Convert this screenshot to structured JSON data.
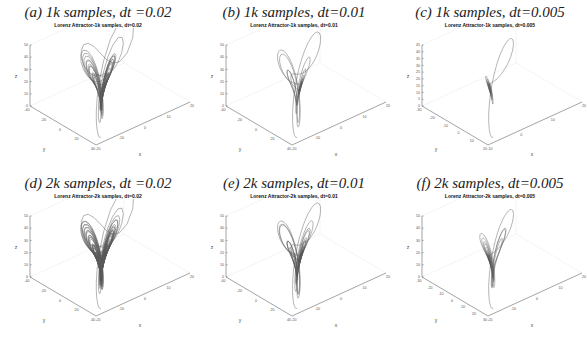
{
  "figure": {
    "panels": [
      {
        "id": "a",
        "caption": "(a) 1k samples, dt =0.02",
        "subtitle": "Lorenz Attractor-1k samples, dt=0.02"
      },
      {
        "id": "b",
        "caption": "(b) 1k samples, dt=0.01",
        "subtitle": "Lorenz Attractor-1k samples, dt=0.01"
      },
      {
        "id": "c",
        "caption": "(c) 1k samples, dt=0.005",
        "subtitle": "Lorenz Attractor-1k samples, dt=0.005"
      },
      {
        "id": "d",
        "caption": "(d) 2k samples, dt =0.02",
        "subtitle": "Lorenz Attractor-2k samples, dt=0.02"
      },
      {
        "id": "e",
        "caption": "(e) 2k samples, dt=0.01",
        "subtitle": "Lorenz Attractor-2k samples, dt=0.01"
      },
      {
        "id": "f",
        "caption": "(f) 2k samples, dt=0.005",
        "subtitle": "Lorenz Attractor-2k samples, dt=0.005"
      }
    ]
  },
  "chart_data": [
    {
      "type": "line",
      "title": "Lorenz Attractor-1k samples, dt=0.02",
      "samples": 1000,
      "dt": 0.02,
      "xlabel": "x",
      "ylabel": "y",
      "zlabel": "z",
      "xticks": [
        -20,
        -10,
        0,
        10,
        20
      ],
      "yticks": [
        -40,
        -20,
        0,
        20,
        40
      ],
      "zticks": [
        0,
        10,
        20,
        30,
        40,
        50
      ],
      "zlim": [
        0,
        50
      ]
    },
    {
      "type": "line",
      "title": "Lorenz Attractor-1k samples, dt=0.01",
      "samples": 1000,
      "dt": 0.01,
      "xlabel": "x",
      "ylabel": "y",
      "zlabel": "z",
      "xticks": [
        -20,
        -10,
        0,
        10,
        20
      ],
      "yticks": [
        -40,
        -20,
        0,
        20,
        40
      ],
      "zticks": [
        0,
        10,
        20,
        30,
        40,
        50
      ],
      "zlim": [
        0,
        50
      ]
    },
    {
      "type": "line",
      "title": "Lorenz Attractor-1k samples, dt=0.005",
      "samples": 1000,
      "dt": 0.005,
      "xlabel": "x",
      "ylabel": "y",
      "zlabel": "z",
      "xticks": [
        -10,
        0,
        10,
        20
      ],
      "yticks": [
        -30,
        -20,
        -10,
        0,
        10,
        20
      ],
      "zticks": [
        0,
        5,
        10,
        15,
        20,
        25,
        30,
        35,
        40,
        45
      ],
      "zlim": [
        0,
        45
      ]
    },
    {
      "type": "line",
      "title": "Lorenz Attractor-2k samples, dt=0.02",
      "samples": 2000,
      "dt": 0.02,
      "xlabel": "x",
      "ylabel": "y",
      "zlabel": "z",
      "xticks": [
        -20,
        -10,
        0,
        10,
        20
      ],
      "yticks": [
        -40,
        -20,
        0,
        20,
        40
      ],
      "zticks": [
        0,
        10,
        20,
        30,
        40,
        50
      ],
      "zlim": [
        0,
        50
      ]
    },
    {
      "type": "line",
      "title": "Lorenz Attractor-2k samples, dt=0.01",
      "samples": 2000,
      "dt": 0.01,
      "xlabel": "x",
      "ylabel": "y",
      "zlabel": "z",
      "xticks": [
        -20,
        -10,
        0,
        10,
        20
      ],
      "yticks": [
        -40,
        -20,
        0,
        20,
        40
      ],
      "zticks": [
        0,
        10,
        20,
        30,
        40,
        50
      ],
      "zlim": [
        0,
        50
      ]
    },
    {
      "type": "line",
      "title": "Lorenz Attractor-2k samples, dt=0.005",
      "samples": 2000,
      "dt": 0.005,
      "xlabel": "x",
      "ylabel": "y",
      "zlabel": "z",
      "xticks": [
        -20,
        -10,
        0,
        10,
        20
      ],
      "yticks": [
        -30,
        -20,
        -10,
        0,
        10,
        20,
        30
      ],
      "zticks": [
        0,
        10,
        20,
        30,
        40,
        50
      ],
      "zlim": [
        0,
        50
      ]
    }
  ]
}
